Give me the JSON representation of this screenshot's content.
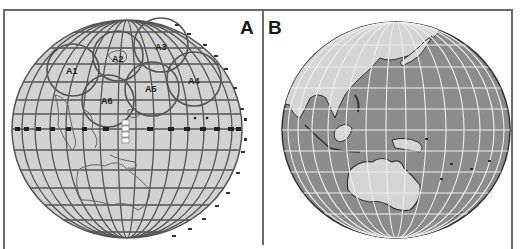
{
  "figure": {
    "panels": [
      {
        "label": "A",
        "description": "Globe with coverage circles over East Asia / Western Pacific, equator marker line",
        "style": {
          "globe_fill": "#d2d2d2",
          "grid_color": "#555555",
          "coast_color": "#555555"
        },
        "coverage_areas": [
          {
            "label": "A1"
          },
          {
            "label": "A2"
          },
          {
            "label": "A3"
          },
          {
            "label": "A4"
          },
          {
            "label": "A5"
          },
          {
            "label": "A6"
          }
        ]
      },
      {
        "label": "B",
        "description": "Globe centered on Western Pacific showing Asia, Indonesia, Australia",
        "style": {
          "ocean_fill": "#8c8c8c",
          "land_fill": "#d4d4d4",
          "grid_color": "#eeeeee",
          "coast_color": "#333333"
        }
      }
    ]
  }
}
